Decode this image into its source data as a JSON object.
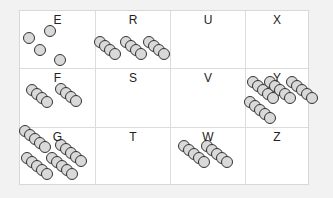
{
  "grid": {
    "cells": [
      {
        "label": "E",
        "count": 4
      },
      {
        "label": "R",
        "count": 12
      },
      {
        "label": "U",
        "count": 0
      },
      {
        "label": "X",
        "count": 0
      },
      {
        "label": "F",
        "count": 8
      },
      {
        "label": "S",
        "count": 0
      },
      {
        "label": "V",
        "count": 0
      },
      {
        "label": "Y",
        "count": 20
      },
      {
        "label": "G",
        "count": 20
      },
      {
        "label": "T",
        "count": 0
      },
      {
        "label": "W",
        "count": 10
      },
      {
        "label": "Z",
        "count": 0
      }
    ]
  },
  "colors": {
    "circle_fill": "#d9d9d9",
    "circle_stroke": "#333333"
  }
}
